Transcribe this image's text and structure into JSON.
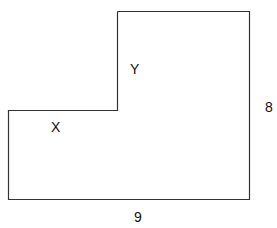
{
  "diagram": {
    "shape": "L-shaped polygon",
    "labels": {
      "region_upper": "Y",
      "region_lower": "X",
      "side_right": "8",
      "side_bottom": "9"
    },
    "stroke_color": "#333333"
  }
}
